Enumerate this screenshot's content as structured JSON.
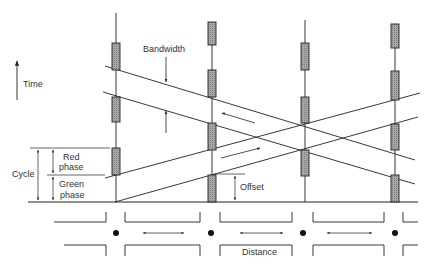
{
  "diagram": {
    "labels": {
      "time": "Time",
      "bandwidth": "Bandwidth",
      "cycle": "Cycle",
      "red_phase_1": "Red",
      "red_phase_2": "phase",
      "green_phase_1": "Green",
      "green_phase_2": "phase",
      "offset": "Offset",
      "distance": "Distance"
    },
    "caption": "FIGURE 13.5  Illustration of time-space diagram showing progression bandwidth and offsets (partially cut off)",
    "colors": {
      "line": "#222222",
      "red_bar_fill": "#9a9a9a",
      "background": "#ffffff"
    },
    "intersections": [
      {
        "x": 116,
        "red_bars": [
          [
            43,
            70
          ],
          [
            97,
            122
          ],
          [
            148,
            175
          ]
        ]
      },
      {
        "x": 212,
        "red_bars": [
          [
            22,
            45
          ],
          [
            70,
            97
          ],
          [
            123,
            150
          ],
          [
            175,
            202
          ]
        ]
      },
      {
        "x": 305,
        "red_bars": [
          [
            43,
            70
          ],
          [
            97,
            123
          ],
          [
            150,
            176
          ]
        ]
      },
      {
        "x": 395,
        "red_bars": [
          [
            24,
            48
          ],
          [
            71,
            100
          ],
          [
            124,
            150
          ],
          [
            175,
            202
          ]
        ]
      }
    ],
    "bands": {
      "westbound": {
        "direction": "right-to-left",
        "lines": [
          [
            105,
            66,
            415,
            160
          ],
          [
            103,
            92,
            415,
            184
          ]
        ]
      },
      "eastbound": {
        "direction": "left-to-right",
        "lines": [
          [
            105,
            178,
            420,
            93
          ],
          [
            115,
            202,
            418,
            117
          ]
        ]
      }
    }
  }
}
